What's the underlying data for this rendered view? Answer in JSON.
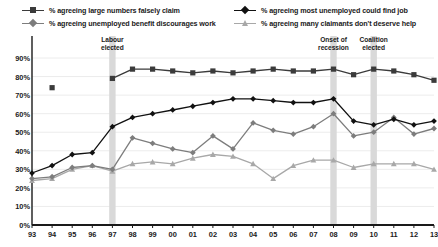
{
  "legend": {
    "items": [
      {
        "label": "% agreeing large numbers falsely claim",
        "color": "#3b3b3b",
        "marker": "square",
        "pos": "r0c0"
      },
      {
        "label": "% agreeing unemployed benefit discourages work",
        "color": "#7d7d7d",
        "marker": "diamond",
        "pos": "r1c0"
      },
      {
        "label": "% agreeing most unemployed could find job",
        "color": "#111111",
        "marker": "diamond",
        "pos": "r0c1"
      },
      {
        "label": "% agreeing many claimants don't deserve help",
        "color": "#a8a8a8",
        "marker": "triangle",
        "pos": "r1c1"
      }
    ]
  },
  "annotations": [
    {
      "text": "Labour elected",
      "line1": "Labour",
      "line2": "elected",
      "year": "97"
    },
    {
      "text": "Onset of recession",
      "line1": "Onset of",
      "line2": "recession",
      "year": "08"
    },
    {
      "text": "Coalition elected",
      "line1": "Coalition",
      "line2": "elected",
      "year": "10"
    }
  ],
  "axes": {
    "y_ticks": [
      "0%",
      "10%",
      "20%",
      "30%",
      "40%",
      "50%",
      "60%",
      "70%",
      "80%",
      "90%"
    ],
    "y_min": 0,
    "y_max": 90,
    "x_ticks": [
      "93",
      "94",
      "95",
      "96",
      "97",
      "98",
      "99",
      "00",
      "01",
      "02",
      "03",
      "04",
      "05",
      "06",
      "07",
      "08",
      "09",
      "10",
      "11",
      "12",
      "13"
    ]
  },
  "colors": {
    "series_falsely_claim": "#3b3b3b",
    "series_discourages_work": "#7d7d7d",
    "series_could_find_job": "#111111",
    "series_dont_deserve_help": "#a8a8a8",
    "gridline": "#ececec",
    "axis": "#1a1a1a",
    "band": "#d9d9d9",
    "background": "#ffffff"
  },
  "chart_data": {
    "type": "line",
    "title": "",
    "xlabel": "",
    "ylabel": "",
    "ylim": [
      0,
      90
    ],
    "grid": true,
    "legend_position": "top",
    "categories": [
      "93",
      "94",
      "95",
      "96",
      "97",
      "98",
      "99",
      "00",
      "01",
      "02",
      "03",
      "04",
      "05",
      "06",
      "07",
      "08",
      "09",
      "10",
      "11",
      "12",
      "13"
    ],
    "shaded_bands": [
      {
        "label": "Labour elected",
        "category": "97"
      },
      {
        "label": "Onset of recession",
        "category": "08"
      },
      {
        "label": "Coalition elected",
        "category": "10"
      }
    ],
    "series": [
      {
        "name": "% agreeing large numbers falsely claim",
        "color": "#3b3b3b",
        "marker": "square",
        "values": [
          null,
          74,
          null,
          null,
          79,
          84,
          84,
          83,
          82,
          83,
          82,
          83,
          84,
          83,
          83,
          84,
          81,
          84,
          83,
          81,
          78
        ]
      },
      {
        "name": "% agreeing most unemployed could find job",
        "color": "#111111",
        "marker": "diamond",
        "values": [
          28,
          32,
          38,
          39,
          53,
          58,
          60,
          62,
          64,
          66,
          68,
          68,
          67,
          66,
          66,
          68,
          56,
          54,
          57,
          54,
          56
        ]
      },
      {
        "name": "% agreeing unemployed benefit discourages work",
        "color": "#7d7d7d",
        "marker": "diamond",
        "values": [
          25,
          26,
          31,
          32,
          30,
          47,
          44,
          41,
          39,
          48,
          41,
          55,
          51,
          49,
          53,
          60,
          48,
          50,
          58,
          49,
          52
        ]
      },
      {
        "name": "% agreeing many claimants don't deserve help",
        "color": "#a8a8a8",
        "marker": "triangle",
        "values": [
          24,
          25,
          30,
          32,
          29,
          33,
          34,
          33,
          36,
          38,
          37,
          33,
          25,
          32,
          35,
          35,
          31,
          33,
          33,
          33,
          30
        ]
      }
    ]
  }
}
